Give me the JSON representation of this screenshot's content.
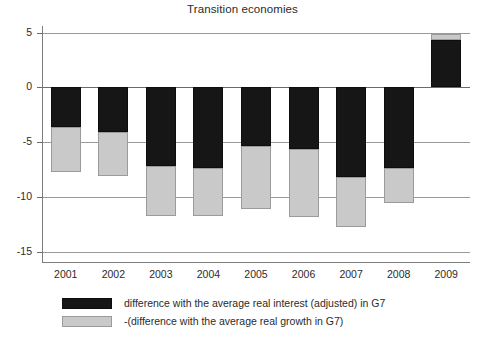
{
  "chart_data": {
    "type": "bar",
    "title": "Transition economies",
    "xlabel": "",
    "ylabel": "",
    "stacked": true,
    "grid": true,
    "legend_position": "bottom-left",
    "ylim": [
      -16,
      5.6
    ],
    "yticks": [
      5,
      0,
      -5,
      -10,
      -15
    ],
    "ytick_labels": [
      "5",
      "0",
      "-5",
      "-10",
      "-15"
    ],
    "categories": [
      "2001",
      "2002",
      "2003",
      "2004",
      "2005",
      "2006",
      "2007",
      "2008",
      "2009"
    ],
    "series": [
      {
        "name": "difference with the average real interest (adjusted) in G7",
        "color": "#161616",
        "values": [
          -3.6,
          -4.1,
          -7.2,
          -7.3,
          -5.3,
          -5.6,
          -8.2,
          -7.3,
          4.3
        ]
      },
      {
        "name": "-(difference with the average real growth in G7)",
        "color": "#c9c9c9",
        "values": [
          -4.1,
          -4.0,
          -4.5,
          -4.4,
          -5.8,
          -6.2,
          -4.5,
          -3.2,
          0.6
        ]
      }
    ],
    "totals": [
      -7.7,
      -8.1,
      -11.7,
      -11.7,
      -11.1,
      -11.8,
      -12.7,
      -10.5,
      4.9
    ]
  },
  "legend": {
    "items": [
      {
        "label": "difference with the average real interest (adjusted) in G7",
        "swatch": "black"
      },
      {
        "label": "-(difference with the average real growth in G7)",
        "swatch": "gray"
      }
    ]
  }
}
